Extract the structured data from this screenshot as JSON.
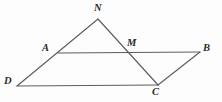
{
  "figure": {
    "width": 222,
    "height": 102,
    "background_color": "#fdfdfd",
    "line_color": "#5d5d5d",
    "label_color": "#2b2b2b",
    "points": {
      "N": {
        "label": "N",
        "x": 98,
        "y": 19,
        "label_x": 94,
        "label_y": 3
      },
      "A": {
        "label": "A",
        "x": 58,
        "y": 53,
        "label_x": 42,
        "label_y": 43
      },
      "M": {
        "label": "M",
        "x": 133,
        "y": 53,
        "label_x": 127,
        "label_y": 38
      },
      "B": {
        "label": "B",
        "x": 200,
        "y": 52,
        "label_x": 203,
        "label_y": 43
      },
      "D": {
        "label": "D",
        "x": 17,
        "y": 86,
        "label_x": 4,
        "label_y": 76
      },
      "C": {
        "label": "C",
        "x": 158,
        "y": 85,
        "label_x": 152,
        "label_y": 87
      }
    },
    "segments": [
      {
        "name": "segment-N-D",
        "from": "N",
        "to": "D",
        "path": "M 98 19 L 17 86"
      },
      {
        "name": "segment-N-C",
        "from": "N",
        "to": "C",
        "path": "M 98 19 L 158 85"
      },
      {
        "name": "segment-A-B",
        "from": "A",
        "to": "B",
        "path": "M 58 53 L 200 52"
      },
      {
        "name": "segment-D-C",
        "from": "D",
        "to": "C",
        "path": "M 17 86 L 158 85"
      },
      {
        "name": "segment-C-B",
        "from": "C",
        "to": "B",
        "path": "M 158 85 L 200 52"
      }
    ]
  }
}
